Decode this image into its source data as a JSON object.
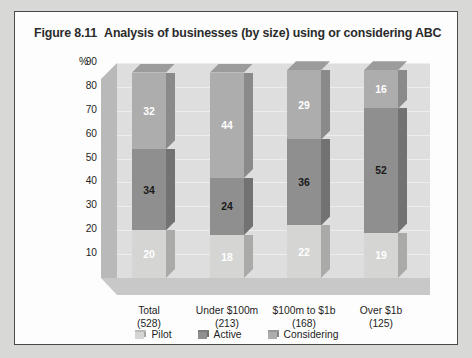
{
  "figure": {
    "number": "Figure 8.11",
    "title": "Analysis of businesses (by size) using or considering ABC"
  },
  "axis": {
    "percent_symbol": "%",
    "yticks": [
      "90",
      "80",
      "70",
      "60",
      "50",
      "40",
      "30",
      "20",
      "10"
    ]
  },
  "legend": [
    {
      "label": "Pilot",
      "color": "#d5d5d3"
    },
    {
      "label": "Active",
      "color": "#8f8f8f"
    },
    {
      "label": "Considering",
      "color": "#adadad"
    }
  ],
  "categories": [
    {
      "name": "Total",
      "count": "(528)"
    },
    {
      "name": "Under $100m",
      "count": "(213)"
    },
    {
      "name": "$100m to $1b",
      "count": "(168)"
    },
    {
      "name": "Over $1b",
      "count": "(125)"
    }
  ],
  "bars": [
    {
      "pilot": "20",
      "active": "34",
      "considering": "32"
    },
    {
      "pilot": "18",
      "active": "24",
      "considering": "44"
    },
    {
      "pilot": "22",
      "active": "36",
      "considering": "29"
    },
    {
      "pilot": "19",
      "active": "52",
      "considering": "16"
    }
  ],
  "chart_data": {
    "type": "bar",
    "subtype": "stacked-3d-column",
    "xlabel": "",
    "ylabel": "%",
    "ylim": [
      0,
      90
    ],
    "ytick_step": 10,
    "grid": true,
    "legend_position": "bottom",
    "categories": [
      "Total (528)",
      "Under $100m (213)",
      "$100m to $1b (168)",
      "Over $1b (125)"
    ],
    "category_counts": [
      528,
      213,
      168,
      125
    ],
    "series": [
      {
        "name": "Pilot",
        "color": "#d5d5d3",
        "values": [
          20,
          18,
          22,
          19
        ]
      },
      {
        "name": "Active",
        "color": "#8f8f8f",
        "values": [
          34,
          24,
          36,
          52
        ]
      },
      {
        "name": "Considering",
        "color": "#adadad",
        "values": [
          32,
          44,
          29,
          16
        ]
      }
    ],
    "stack_totals": [
      86,
      86,
      87,
      87
    ]
  }
}
